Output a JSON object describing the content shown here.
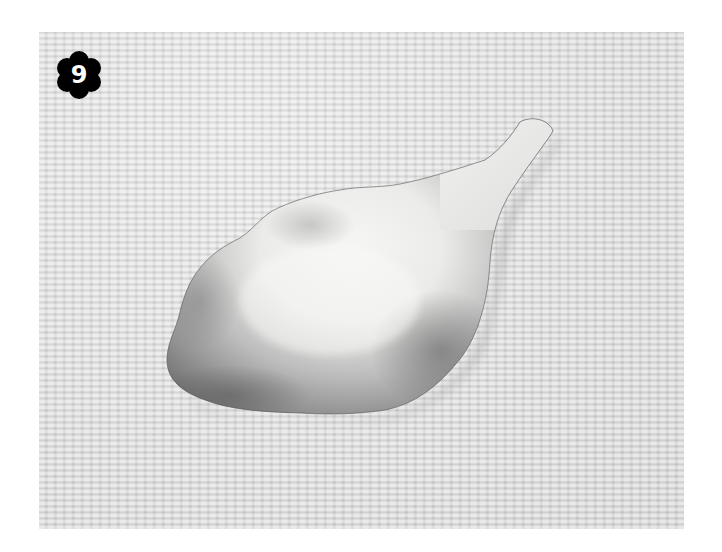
{
  "figure": {
    "step_number": "9",
    "colors": {
      "page_background": "#ffffff",
      "fabric": "#d9d9d9",
      "petal_light": "#f4f4f2",
      "petal_dark": "#6e6e6e",
      "badge": "#000000",
      "badge_text": "#ffffff"
    }
  }
}
